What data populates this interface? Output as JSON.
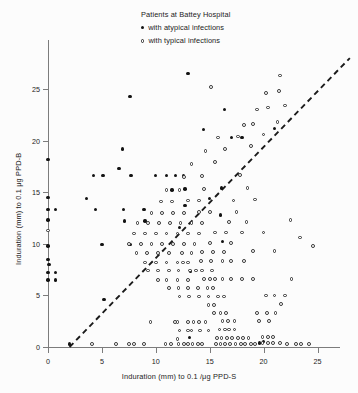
{
  "legend": {
    "title": "Patients at Battey Hospital",
    "entries": [
      {
        "marker": "filled-circle",
        "label": "with atypical infections"
      },
      {
        "marker": "open-circle",
        "label": "with typical infections"
      }
    ]
  },
  "chart_data": {
    "type": "scatter",
    "title": "",
    "xlabel": "Induration (mm) to 0.1 /μg PPD-S",
    "ylabel": "Induration (mm) to 0.1 μg PPD-B",
    "xlim": [
      -1,
      27
    ],
    "ylim": [
      -1,
      28
    ],
    "xticks": [
      0,
      5,
      10,
      15,
      20,
      25
    ],
    "yticks": [
      0,
      5,
      10,
      15,
      20,
      25
    ],
    "grid": false,
    "legend_position": "top-center",
    "annotations": [
      {
        "type": "line",
        "style": "dashed",
        "label": "identity line y = x",
        "x0": 2,
        "y0": 0,
        "x1": 28,
        "y1": 28
      }
    ],
    "series": [
      {
        "name": "with atypical infections",
        "marker": "filled-circle",
        "color": "#131313",
        "points": [
          [
            0,
            18.2
          ],
          [
            0,
            14.5
          ],
          [
            0,
            13.3
          ],
          [
            0.7,
            13.3
          ],
          [
            0,
            12.3
          ],
          [
            0,
            9.8
          ],
          [
            0,
            8.5
          ],
          [
            0.1,
            8.0
          ],
          [
            0,
            7.2
          ],
          [
            0.7,
            7.2
          ],
          [
            0,
            6.5
          ],
          [
            0.7,
            6.5
          ],
          [
            2.0,
            0.3
          ],
          [
            3.6,
            14.4
          ],
          [
            4.2,
            16.6
          ],
          [
            4.4,
            13.3
          ],
          [
            5.1,
            16.6
          ],
          [
            5.0,
            9.9
          ],
          [
            5.2,
            4.6
          ],
          [
            6.6,
            17.3
          ],
          [
            6.9,
            19.2
          ],
          [
            7.0,
            13.3
          ],
          [
            7.1,
            12.2
          ],
          [
            7.6,
            24.3
          ],
          [
            7.7,
            16.6
          ],
          [
            7.6,
            9.9
          ],
          [
            8.9,
            13.3
          ],
          [
            9.0,
            12.2
          ],
          [
            10.0,
            16.6
          ],
          [
            11.0,
            16.6
          ],
          [
            11.8,
            16.6
          ],
          [
            12.6,
            16.6
          ],
          [
            11.5,
            15.2
          ],
          [
            12.7,
            15.3
          ],
          [
            12.2,
            11.6
          ],
          [
            12.7,
            13.7
          ],
          [
            13.0,
            26.5
          ],
          [
            13.2,
            7.3
          ],
          [
            13.1,
            0.9
          ],
          [
            14.4,
            21.1
          ],
          [
            15.0,
            14.4
          ],
          [
            16.4,
            23.0
          ],
          [
            17.0,
            20.3
          ],
          [
            18.0,
            20.3
          ],
          [
            16.1,
            15.4
          ],
          [
            16.0,
            12.8
          ],
          [
            16.2,
            10.2
          ],
          [
            19.6,
            0.4
          ],
          [
            20.0,
            0.5
          ],
          [
            21.0,
            21.2
          ]
        ]
      },
      {
        "name": "with typical infections",
        "marker": "open-circle",
        "color": "#2f2f2f",
        "points": [
          [
            0,
            11.3
          ],
          [
            4.1,
            0.3
          ],
          [
            6.3,
            0.3
          ],
          [
            7.5,
            0.3
          ],
          [
            8.0,
            0.3
          ],
          [
            8.9,
            0.3
          ],
          [
            9.5,
            2.4
          ],
          [
            11.8,
            2.4
          ],
          [
            10.9,
            0.3
          ],
          [
            11.4,
            0.3
          ],
          [
            12.0,
            0.8
          ],
          [
            12.1,
            0.3
          ],
          [
            12.6,
            0.3
          ],
          [
            13.0,
            0.3
          ],
          [
            13.4,
            0.3
          ],
          [
            13.9,
            0.3
          ],
          [
            14.3,
            0.3
          ],
          [
            12.2,
            1.6
          ],
          [
            13.0,
            1.6
          ],
          [
            13.3,
            1.6
          ],
          [
            14.1,
            1.6
          ],
          [
            14.9,
            1.6
          ],
          [
            12.0,
            2.4
          ],
          [
            13.0,
            2.4
          ],
          [
            13.5,
            2.4
          ],
          [
            14.0,
            2.4
          ],
          [
            14.6,
            2.4
          ],
          [
            15.6,
            0.3
          ],
          [
            16.0,
            0.3
          ],
          [
            16.4,
            0.3
          ],
          [
            16.9,
            0.3
          ],
          [
            17.4,
            0.3
          ],
          [
            17.9,
            0.3
          ],
          [
            18.3,
            0.3
          ],
          [
            18.8,
            0.3
          ],
          [
            19.2,
            0.3
          ],
          [
            15.7,
            0.9
          ],
          [
            16.1,
            0.9
          ],
          [
            16.6,
            0.9
          ],
          [
            17.1,
            0.9
          ],
          [
            17.6,
            0.9
          ],
          [
            18.1,
            0.9
          ],
          [
            18.6,
            0.9
          ],
          [
            15.9,
            1.7
          ],
          [
            16.4,
            1.7
          ],
          [
            16.8,
            1.7
          ],
          [
            17.3,
            1.7
          ],
          [
            16.2,
            2.5
          ],
          [
            16.7,
            2.5
          ],
          [
            17.3,
            2.5
          ],
          [
            19.9,
            0.4
          ],
          [
            20.4,
            0.4
          ],
          [
            20.9,
            0.4
          ],
          [
            21.5,
            0.4
          ],
          [
            22.2,
            0.3
          ],
          [
            23.0,
            0.3
          ],
          [
            23.5,
            0.3
          ],
          [
            24.2,
            0.3
          ],
          [
            19.9,
            1.0
          ],
          [
            20.4,
            1.0
          ],
          [
            20.9,
            1.0
          ],
          [
            15.4,
            3.3
          ],
          [
            16.0,
            3.3
          ],
          [
            16.5,
            3.3
          ],
          [
            14.9,
            4.1
          ],
          [
            15.4,
            4.1
          ],
          [
            12.2,
            4.9
          ],
          [
            13.1,
            4.9
          ],
          [
            14.0,
            4.9
          ],
          [
            14.9,
            4.9
          ],
          [
            15.8,
            4.9
          ],
          [
            16.3,
            4.9
          ],
          [
            11.2,
            5.7
          ],
          [
            12.1,
            5.7
          ],
          [
            13.0,
            5.7
          ],
          [
            13.9,
            5.7
          ],
          [
            14.8,
            5.7
          ],
          [
            15.3,
            5.7
          ],
          [
            10.2,
            6.5
          ],
          [
            11.0,
            6.5
          ],
          [
            12.0,
            6.5
          ],
          [
            13.0,
            6.5
          ],
          [
            14.5,
            6.6
          ],
          [
            15.0,
            6.6
          ],
          [
            15.5,
            6.6
          ],
          [
            16.2,
            6.6
          ],
          [
            17.0,
            6.6
          ],
          [
            18.0,
            6.6
          ],
          [
            19.0,
            6.6
          ],
          [
            9.3,
            7.4
          ],
          [
            10.2,
            7.4
          ],
          [
            11.2,
            7.4
          ],
          [
            12.1,
            7.4
          ],
          [
            13.2,
            7.4
          ],
          [
            13.7,
            7.4
          ],
          [
            14.3,
            7.4
          ],
          [
            15.2,
            7.4
          ],
          [
            9.0,
            8.2
          ],
          [
            10.0,
            8.2
          ],
          [
            11.0,
            8.2
          ],
          [
            12.0,
            8.2
          ],
          [
            12.5,
            8.2
          ],
          [
            13.0,
            8.2
          ],
          [
            14.2,
            8.3
          ],
          [
            15.1,
            8.3
          ],
          [
            16.2,
            8.3
          ],
          [
            17.0,
            8.3
          ],
          [
            18.2,
            8.3
          ],
          [
            8.2,
            9.1
          ],
          [
            9.2,
            9.1
          ],
          [
            10.2,
            9.1
          ],
          [
            11.2,
            9.1
          ],
          [
            12.4,
            9.1
          ],
          [
            13.3,
            9.1
          ],
          [
            14.3,
            9.2
          ],
          [
            15.3,
            9.2
          ],
          [
            16.3,
            9.2
          ],
          [
            19.0,
            9.3
          ],
          [
            21.0,
            9.3
          ],
          [
            7.5,
            10.0
          ],
          [
            8.6,
            10.0
          ],
          [
            9.6,
            10.0
          ],
          [
            10.6,
            10.0
          ],
          [
            11.6,
            10.0
          ],
          [
            12.6,
            10.0
          ],
          [
            13.6,
            10.0
          ],
          [
            15.0,
            10.1
          ],
          [
            17.0,
            10.1
          ],
          [
            8.0,
            11.0
          ],
          [
            9.0,
            11.0
          ],
          [
            10.0,
            11.0
          ],
          [
            11.0,
            11.0
          ],
          [
            12.0,
            11.0
          ],
          [
            13.0,
            11.0
          ],
          [
            14.0,
            11.0
          ],
          [
            15.5,
            11.1
          ],
          [
            16.5,
            11.1
          ],
          [
            18.0,
            11.1
          ],
          [
            20.0,
            11.1
          ],
          [
            8.3,
            12.0
          ],
          [
            9.3,
            12.0
          ],
          [
            10.3,
            12.0
          ],
          [
            11.3,
            12.0
          ],
          [
            12.3,
            12.0
          ],
          [
            13.3,
            12.0
          ],
          [
            14.3,
            12.0
          ],
          [
            16.8,
            12.1
          ],
          [
            18.4,
            12.1
          ],
          [
            9.6,
            13.0
          ],
          [
            10.6,
            13.0
          ],
          [
            11.6,
            13.0
          ],
          [
            12.6,
            13.0
          ],
          [
            14.0,
            13.1
          ],
          [
            15.0,
            13.1
          ],
          [
            17.5,
            13.1
          ],
          [
            10.5,
            14.1
          ],
          [
            11.5,
            14.1
          ],
          [
            13.0,
            14.2
          ],
          [
            14.0,
            14.2
          ],
          [
            17.2,
            14.2
          ],
          [
            19.2,
            14.3
          ],
          [
            11.0,
            15.2
          ],
          [
            12.2,
            15.2
          ],
          [
            14.5,
            15.3
          ],
          [
            18.5,
            15.4
          ],
          [
            12.6,
            16.5
          ],
          [
            14.3,
            16.6
          ],
          [
            17.8,
            16.7
          ],
          [
            13.3,
            17.7
          ],
          [
            15.5,
            17.9
          ],
          [
            14.6,
            19.0
          ],
          [
            16.4,
            19.2
          ],
          [
            18.8,
            19.5
          ],
          [
            15.8,
            20.3
          ],
          [
            17.6,
            20.4
          ],
          [
            20.0,
            20.6
          ],
          [
            18.2,
            21.5
          ],
          [
            19.0,
            21.6
          ],
          [
            21.3,
            21.8
          ],
          [
            19.4,
            23.0
          ],
          [
            20.4,
            23.2
          ],
          [
            22.0,
            23.4
          ],
          [
            20.2,
            24.6
          ],
          [
            21.4,
            24.8
          ],
          [
            15.1,
            25.2
          ],
          [
            21.5,
            26.3
          ],
          [
            22.5,
            12.3
          ],
          [
            24.6,
            9.8
          ],
          [
            23.4,
            10.6
          ],
          [
            20.2,
            5.0
          ],
          [
            21.0,
            5.0
          ],
          [
            22.0,
            5.0
          ],
          [
            19.4,
            3.3
          ],
          [
            20.3,
            3.3
          ],
          [
            21.1,
            3.3
          ],
          [
            19.6,
            2.5
          ],
          [
            20.5,
            2.5
          ],
          [
            22.6,
            6.6
          ],
          [
            21.6,
            4.2
          ]
        ]
      }
    ]
  }
}
